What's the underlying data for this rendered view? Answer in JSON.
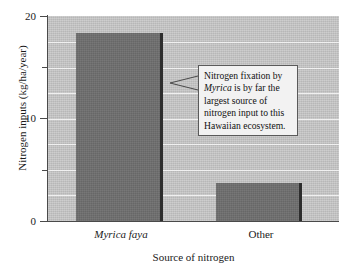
{
  "chart_data": {
    "type": "bar",
    "title": "",
    "subtitle": "",
    "xlabel": "Source of nitrogen",
    "ylabel": "Nitrogen inputs (kg/ha/year)",
    "categories": [
      "Myrica faya",
      "Other"
    ],
    "values": [
      18.3,
      3.7
    ],
    "series": [
      {
        "name": "Nitrogen inputs",
        "values": [
          18.3,
          3.7
        ]
      }
    ],
    "ylim": [
      0,
      20
    ],
    "ytick_labels": [
      "0",
      "10",
      "20"
    ],
    "ytick_values": [
      0,
      10,
      20
    ],
    "yminor_tick_values": [
      5,
      15
    ],
    "gridlines": [
      2.5,
      5,
      7.5,
      10,
      12.5,
      15,
      17.5
    ],
    "grid": true,
    "legend": "none",
    "annotations": [
      {
        "id": "callout",
        "line1": "Nitrogen fixation by",
        "line2_italic": "Myrica",
        "line2_rest": " is by far the",
        "line3": "largest source of",
        "line4": "nitrogen input to this",
        "line5": "Hawaiian ecosystem.",
        "points_to_category": "Myrica faya"
      }
    ],
    "colors": {
      "bar_fill": "#6e6e6e",
      "bar_edge": "#2d2d2d",
      "plot_background": "#c8c8c8",
      "gridline": "#f0f0f0",
      "axis": "#4a4a4a",
      "callout_background": "#f2f2f2",
      "callout_border": "#5a5a5a",
      "text": "#1a1a1a",
      "figure_background": "#ffffff"
    }
  },
  "axis": {
    "y_title": "Nitrogen inputs (kg/ha/year)",
    "x_title": "Source of nitrogen",
    "y_ticks": [
      {
        "label": "20",
        "value": 20
      },
      {
        "label": "10",
        "value": 10
      },
      {
        "label": "0",
        "value": 0
      }
    ]
  },
  "categories": [
    {
      "label": "Myrica faya",
      "italic": true
    },
    {
      "label": "Other",
      "italic": false
    }
  ],
  "callout": {
    "line1": "Nitrogen fixation by",
    "italic_word": "Myrica",
    "line2_rest": " is by far the",
    "line3": "largest source of",
    "line4": "nitrogen input to this",
    "line5": "Hawaiian ecosystem."
  }
}
